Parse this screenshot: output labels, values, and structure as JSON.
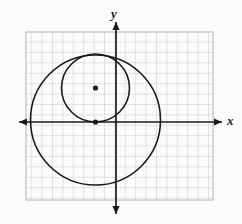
{
  "figure": {
    "kind": "coordinate-plane-diagram",
    "background_color": "#fbfbfb",
    "title": "",
    "axes": {
      "x_label": "x",
      "y_label": "y",
      "axis_color": "#1a1a1a",
      "origin_px": [
        116,
        122
      ],
      "x_axis_y_px": 122,
      "y_axis_x_px": 116,
      "arrow_heads": [
        "left",
        "right",
        "up",
        "down"
      ]
    },
    "grid": {
      "show": true,
      "color": "#c8c8cc",
      "left_px": 26,
      "top_px": 32,
      "right_px": 213,
      "bottom_px": 200,
      "cell_px": 10.4,
      "columns": 18,
      "rows": 16,
      "border_color": "#b4b4b8"
    }
  },
  "chart_data": {
    "type": "scatter",
    "title": "",
    "xlabel": "x",
    "ylabel": "y",
    "grid": true,
    "legend": "none",
    "unit_px": 10.4,
    "origin_px": [
      116,
      122
    ],
    "xlim": [
      -8.65,
      9.33
    ],
    "ylim": [
      -7.5,
      8.65
    ],
    "shapes": [
      {
        "name": "large-circle",
        "type": "circle",
        "center_units": [
          -1.97,
          0.19
        ],
        "center_px": [
          95.5,
          120
        ],
        "radius_units": 6.25,
        "radius_px": 65,
        "stroke": "#1a1a1a",
        "stroke_width_px": 1.6,
        "fill": "none"
      },
      {
        "name": "small-circle",
        "type": "circle",
        "center_units": [
          -1.97,
          3.27
        ],
        "center_px": [
          95.5,
          88
        ],
        "radius_units": 3.27,
        "radius_px": 34,
        "stroke": "#1a1a1a",
        "stroke_width_px": 1.6,
        "fill": "none"
      }
    ],
    "points": [
      {
        "name": "small-circle-center-point",
        "center_units": [
          -1.97,
          3.27
        ],
        "center_px": [
          95.5,
          88
        ],
        "radius_px": 2.6,
        "color": "#1a1a1a"
      },
      {
        "name": "tangent-point-on-x-axis",
        "center_units": [
          -1.97,
          0
        ],
        "center_px": [
          95.5,
          122
        ],
        "radius_px": 2.6,
        "color": "#1a1a1a"
      }
    ],
    "annotations": [
      {
        "name": "x-axis-label",
        "text": "x",
        "px": [
          231,
          122
        ]
      },
      {
        "name": "y-axis-label",
        "text": "y",
        "px": [
          114,
          14
        ]
      }
    ]
  }
}
